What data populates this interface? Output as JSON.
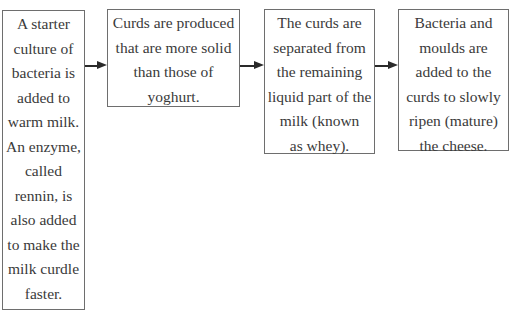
{
  "diagram": {
    "type": "flowchart",
    "direction": "left-to-right",
    "steps": [
      {
        "id": "step-1",
        "lines": [
          "A starter",
          "culture of",
          "bacteria is",
          "added to",
          "warm milk.",
          "An enzyme,",
          "called",
          "rennin, is",
          "also added",
          "to make the",
          "milk curdle",
          "faster."
        ]
      },
      {
        "id": "step-2",
        "lines": [
          "Curds are produced",
          "that are more solid",
          "than those of",
          "yoghurt."
        ]
      },
      {
        "id": "step-3",
        "lines": [
          "The curds are",
          "separated from",
          "the remaining",
          "liquid part of the",
          "milk (known",
          "as whey)."
        ]
      },
      {
        "id": "step-4",
        "lines": [
          "Bacteria and",
          "moulds are",
          "added to the",
          "curds to slowly",
          "ripen (mature)",
          "the cheese."
        ]
      }
    ],
    "arrows": [
      {
        "from": "step-1",
        "to": "step-2",
        "icon": "arrow-right-icon"
      },
      {
        "from": "step-2",
        "to": "step-3",
        "icon": "arrow-right-icon"
      },
      {
        "from": "step-3",
        "to": "step-4",
        "icon": "arrow-right-icon"
      }
    ],
    "colors": {
      "border": "#6e6e6e",
      "text": "#3a3a3a",
      "arrow": "#2a2a2a",
      "background": "#ffffff"
    }
  }
}
